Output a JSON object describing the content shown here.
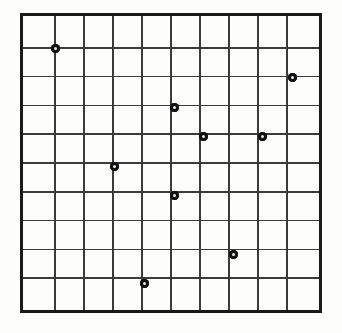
{
  "figure": {
    "title": "",
    "background_color": "#fdfdfb",
    "width": 342,
    "height": 333
  },
  "plot": {
    "border_color": "#1a1a1a",
    "gridline_color": "#3b3b3b",
    "marker_color": "#111111",
    "origin_x": 20,
    "origin_y": 13,
    "cell_size": 30.2,
    "rows": 10,
    "columns": 10
  },
  "chart_data": {
    "type": "scatter",
    "title": "",
    "xlabel": "",
    "ylabel": "",
    "xlim": [
      0,
      10
    ],
    "ylim": [
      0,
      10
    ],
    "grid": true,
    "legend": null,
    "xticklabels": [],
    "yticklabels": [],
    "marker": "filled-circle",
    "marker_size": 9,
    "series": [
      {
        "name": "points",
        "points": [
          {
            "x": 1,
            "y": 9
          },
          {
            "x": 9,
            "y": 8
          },
          {
            "x": 5,
            "y": 7
          },
          {
            "x": 6,
            "y": 6
          },
          {
            "x": 8,
            "y": 6
          },
          {
            "x": 3,
            "y": 5
          },
          {
            "x": 5,
            "y": 4
          },
          {
            "x": 7,
            "y": 2
          },
          {
            "x": 4,
            "y": 1
          }
        ]
      }
    ],
    "count": 9
  }
}
